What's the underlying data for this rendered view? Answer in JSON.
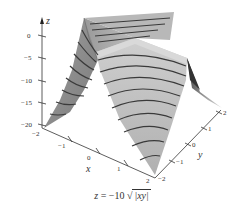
{
  "figure": {
    "function": "z = -10 sqrt(|xy|)",
    "caption": {
      "lhs": "z",
      "eq": " = −10 ",
      "sqrt_symbol": "√",
      "radicand": "|xy|"
    },
    "axes": {
      "z": {
        "label": "z",
        "ticks": [
          "0",
          "−5",
          "−10",
          "−15",
          "−20"
        ]
      },
      "x": {
        "label": "x",
        "ticks": [
          "−2",
          "−1",
          "0",
          "1",
          "2"
        ]
      },
      "y": {
        "label": "y",
        "ticks": [
          "−2",
          "−1",
          "0",
          "1",
          "2"
        ]
      }
    },
    "colors": {
      "surface_dark": "#8a8a8a",
      "surface_mid": "#a8a8a8",
      "surface_light": "#c8c8c8",
      "contour": "#3a3a3a",
      "axis": "#333333"
    }
  }
}
